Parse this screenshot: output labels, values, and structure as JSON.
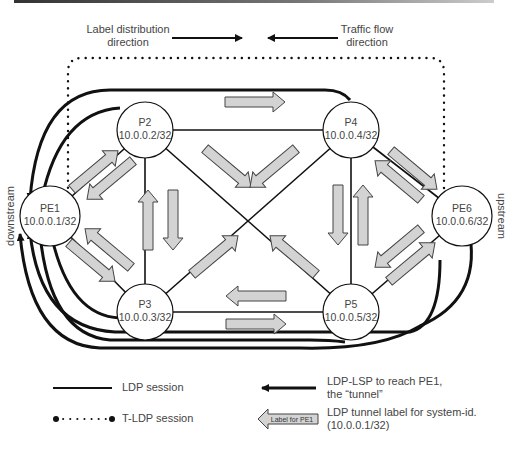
{
  "header": {
    "label_distribution": [
      "Label distribution",
      "direction"
    ],
    "traffic_flow": [
      "Traffic flow",
      "direction"
    ]
  },
  "nodes": [
    {
      "id": "PE1",
      "name": "PE1",
      "ip": "10.0.0.1/32",
      "cx": 50,
      "cy": 216
    },
    {
      "id": "P2",
      "name": "P2",
      "ip": "10.0.0.2/32",
      "cx": 145,
      "cy": 130
    },
    {
      "id": "P4",
      "name": "P4",
      "ip": "10.0.0.4/32",
      "cx": 351,
      "cy": 130
    },
    {
      "id": "PE6",
      "name": "PE6",
      "ip": "10.0.0.6/32",
      "cx": 462,
      "cy": 216
    },
    {
      "id": "P3",
      "name": "P3",
      "ip": "10.0.0.3/32",
      "cx": 145,
      "cy": 312
    },
    {
      "id": "P5",
      "name": "P5",
      "ip": "10.0.0.5/32",
      "cx": 351,
      "cy": 312
    }
  ],
  "side_labels": {
    "left": "downstream",
    "right": "upstream"
  },
  "legend": {
    "ldp_session": "LDP session",
    "tldp_session": "T-LDP session",
    "ldp_lsp": [
      "LDP-LSP to reach PE1,",
      "the “tunnel”"
    ],
    "tunnel_label": [
      "LDP tunnel label for system-id.",
      "(10.0.0.1/32)"
    ],
    "arrow_sample_text": "Label for PE1"
  },
  "colors": {
    "line": "#111111",
    "arrow_fill": "#d3d3d3",
    "arrow_stroke": "#444444",
    "text": "#444444"
  }
}
